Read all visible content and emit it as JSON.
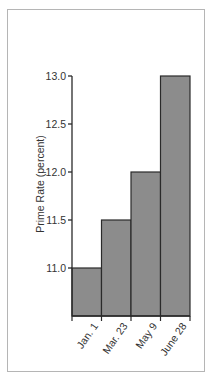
{
  "chart_data": {
    "type": "bar",
    "title": "",
    "xlabel": "",
    "ylabel": "Prime Rate (percent)",
    "categories": [
      "Jan. 1",
      "Mar. 23",
      "May 9",
      "June 28"
    ],
    "values": [
      11.0,
      11.5,
      12.0,
      13.0
    ],
    "ylim": [
      10.5,
      13.0
    ],
    "yticks": [
      "11.0",
      "11.5",
      "12.0",
      "12.5",
      "13.0"
    ],
    "grid": false,
    "legend": "none",
    "bar_color": "#8c8c8c",
    "edge_color": "#2a2a2a"
  }
}
